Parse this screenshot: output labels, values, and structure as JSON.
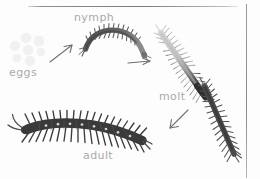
{
  "diagram": {
    "background_color": "#fdfdfd",
    "frame": {
      "top_rule_color": "#7a7a7a",
      "right_rule_color": "#8a8a8a"
    },
    "label_color": "#a9a9a9",
    "stages": [
      {
        "id": "eggs",
        "label": "eggs",
        "order": 1,
        "color": "#f1f1f1",
        "description": "cluster of pale round eggs"
      },
      {
        "id": "nymph",
        "label": "nymph",
        "order": 2,
        "color": "#5a5a5a",
        "description": "small dark curved centipede"
      },
      {
        "id": "molt",
        "label": "molt",
        "order": 3,
        "color": "#c9c9c9",
        "description": "pale shed exoskeleton with dark emerging centipede"
      },
      {
        "id": "adult",
        "label": "adult",
        "order": 4,
        "color": "#3f3f3f",
        "description": "large dark centipede with antennae and spotted body"
      }
    ],
    "arrows": [
      {
        "id": "eggs-to-nymph",
        "direction": "up-right",
        "color": "#707070"
      },
      {
        "id": "nymph-to-molt",
        "direction": "right",
        "color": "#707070"
      },
      {
        "id": "molt-to-adult",
        "direction": "down-left",
        "color": "#707070"
      }
    ],
    "eggs_positions": [
      {
        "cx": 20,
        "cy": 6,
        "r": 5.0
      },
      {
        "cx": 33,
        "cy": 9,
        "r": 4.6
      },
      {
        "cx": 9,
        "cy": 14,
        "r": 5.2
      },
      {
        "cx": 22,
        "cy": 18,
        "r": 5.4
      },
      {
        "cx": 35,
        "cy": 20,
        "r": 4.4
      },
      {
        "cx": 11,
        "cy": 26,
        "r": 4.2
      },
      {
        "cx": 24,
        "cy": 29,
        "r": 4.8
      }
    ]
  }
}
